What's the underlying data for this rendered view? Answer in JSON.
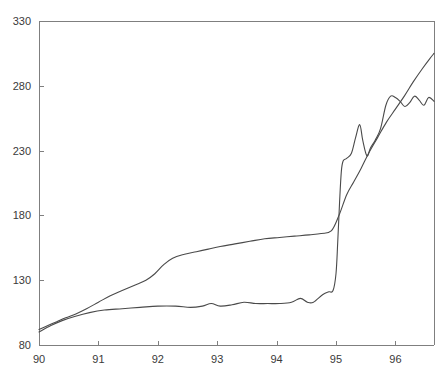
{
  "chart_data": {
    "type": "line",
    "title": "",
    "subtitle": "",
    "xlabel": "",
    "ylabel": "",
    "xlim": [
      90.0,
      96.65
    ],
    "ylim": [
      80,
      330
    ],
    "grid": false,
    "legend": null,
    "legend_position": "none",
    "xticks": [
      90,
      91,
      92,
      93,
      94,
      95,
      96
    ],
    "xtick_labels": [
      "90",
      "91",
      "92",
      "93",
      "94",
      "95",
      "96"
    ],
    "yticks": [
      80,
      130,
      180,
      230,
      280,
      330
    ],
    "ytick_labels": [
      "80",
      "130",
      "180",
      "230",
      "280",
      "330"
    ],
    "annotations": [],
    "series": [
      {
        "name": "series-1",
        "color": "#4a4a4a",
        "points": [
          [
            90.0,
            92
          ],
          [
            90.15,
            95
          ],
          [
            90.3,
            98
          ],
          [
            90.45,
            101
          ],
          [
            90.62,
            104
          ],
          [
            90.8,
            108
          ],
          [
            91.0,
            113
          ],
          [
            91.2,
            118
          ],
          [
            91.4,
            122
          ],
          [
            91.6,
            126
          ],
          [
            91.8,
            130
          ],
          [
            91.95,
            135
          ],
          [
            92.1,
            142
          ],
          [
            92.25,
            147
          ],
          [
            92.45,
            150
          ],
          [
            92.65,
            152
          ],
          [
            92.85,
            154
          ],
          [
            93.05,
            156
          ],
          [
            93.3,
            158
          ],
          [
            93.55,
            160
          ],
          [
            93.8,
            162
          ],
          [
            94.05,
            163
          ],
          [
            94.3,
            164
          ],
          [
            94.55,
            165
          ],
          [
            94.75,
            166
          ],
          [
            94.92,
            168
          ],
          [
            95.05,
            180
          ],
          [
            95.18,
            196
          ],
          [
            95.3,
            206
          ],
          [
            95.42,
            216
          ],
          [
            95.55,
            228
          ],
          [
            95.7,
            240
          ],
          [
            95.85,
            252
          ],
          [
            96.0,
            262
          ],
          [
            96.15,
            272
          ],
          [
            96.3,
            283
          ],
          [
            96.45,
            293
          ],
          [
            96.58,
            301
          ],
          [
            96.65,
            305
          ]
        ]
      },
      {
        "name": "series-2",
        "color": "#4a4a4a",
        "points": [
          [
            90.0,
            90
          ],
          [
            90.2,
            95
          ],
          [
            90.4,
            99
          ],
          [
            90.6,
            102
          ],
          [
            90.85,
            105
          ],
          [
            91.1,
            107
          ],
          [
            91.4,
            108
          ],
          [
            91.7,
            109
          ],
          [
            92.0,
            110
          ],
          [
            92.3,
            110
          ],
          [
            92.55,
            109
          ],
          [
            92.75,
            110
          ],
          [
            92.9,
            112
          ],
          [
            93.05,
            110
          ],
          [
            93.25,
            111
          ],
          [
            93.45,
            113
          ],
          [
            93.65,
            112
          ],
          [
            93.85,
            112
          ],
          [
            94.05,
            112
          ],
          [
            94.25,
            113
          ],
          [
            94.4,
            116
          ],
          [
            94.52,
            113
          ],
          [
            94.62,
            113
          ],
          [
            94.78,
            119
          ],
          [
            94.88,
            121
          ],
          [
            94.95,
            122
          ],
          [
            95.0,
            135
          ],
          [
            95.03,
            160
          ],
          [
            95.06,
            190
          ],
          [
            95.09,
            214
          ],
          [
            95.12,
            222
          ],
          [
            95.18,
            224
          ],
          [
            95.26,
            228
          ],
          [
            95.33,
            240
          ],
          [
            95.4,
            250
          ],
          [
            95.45,
            238
          ],
          [
            95.52,
            226
          ],
          [
            95.58,
            232
          ],
          [
            95.66,
            238
          ],
          [
            95.75,
            247
          ],
          [
            95.84,
            265
          ],
          [
            95.92,
            272
          ],
          [
            96.0,
            271
          ],
          [
            96.08,
            268
          ],
          [
            96.16,
            264
          ],
          [
            96.24,
            267
          ],
          [
            96.32,
            272
          ],
          [
            96.4,
            269
          ],
          [
            96.48,
            265
          ],
          [
            96.56,
            271
          ],
          [
            96.65,
            268
          ]
        ]
      }
    ]
  }
}
